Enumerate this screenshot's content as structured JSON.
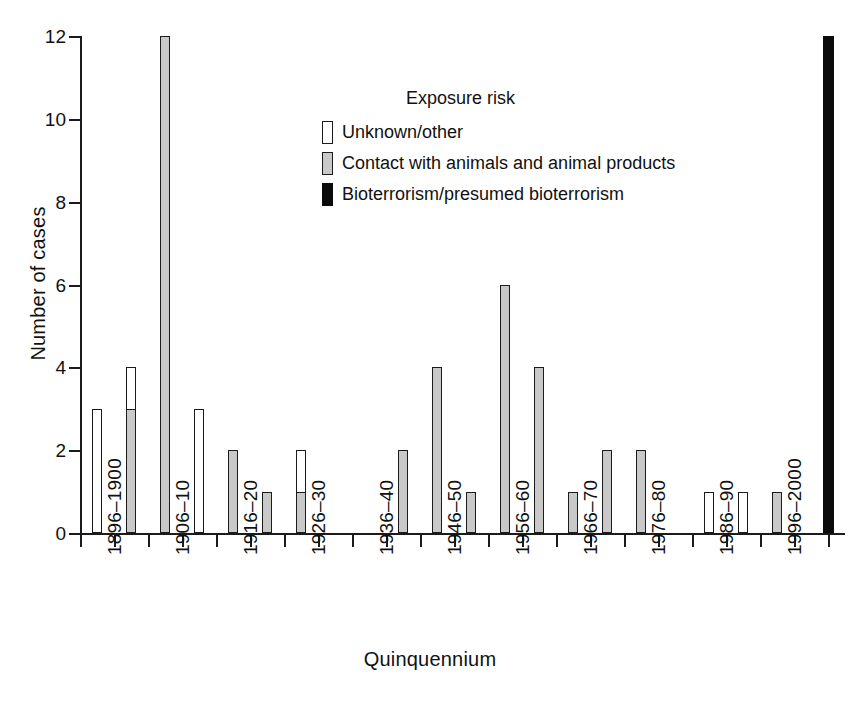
{
  "chart_data": {
    "type": "bar",
    "title": "",
    "xlabel": "Quinquennium",
    "ylabel": "Number of cases",
    "ylim": [
      0,
      12
    ],
    "yticks": [
      0,
      2,
      4,
      6,
      8,
      10,
      12
    ],
    "grid": false,
    "legend_position": "upper-center-right",
    "legend_title": "Exposure risk",
    "series": [
      {
        "name": "Unknown/other",
        "color": "#ffffff"
      },
      {
        "name": "Contact with animals and animal products",
        "color": "#c9c9c9"
      },
      {
        "name": "Bioterrorism/presumed bioterrorism",
        "color": "#0b0b0b"
      }
    ],
    "categories": [
      "1896–1900",
      "1906–10",
      "1916–20",
      "1926–30",
      "1936–40",
      "1946–50",
      "1956–60",
      "1966–70",
      "1976–80",
      "1986–90",
      "1996–2000"
    ],
    "xtick_labels": [
      "1896–1900",
      "1906–10",
      "1916–20",
      "1926–30",
      "1936–40",
      "1946–50",
      "1956–60",
      "1966–70",
      "1976–80",
      "1986–90",
      "1996–2000"
    ],
    "bars": [
      {
        "slot": 1,
        "period": "1896–1900",
        "series": "Unknown/other",
        "value": 3
      },
      {
        "slot": 3,
        "period": "1901–05",
        "series": "Unknown/other",
        "value": 4
      },
      {
        "slot": 3,
        "period": "1901–05",
        "series": "Contact with animals and animal products",
        "value": 3
      },
      {
        "slot": 5,
        "period": "1906–10",
        "series": "Unknown/other",
        "value": 3
      },
      {
        "slot": 5,
        "period": "1906–10",
        "series": "Contact with animals and animal products",
        "value": 12
      },
      {
        "slot": 7,
        "period": "1911–15",
        "series": "Unknown/other",
        "value": 3
      },
      {
        "slot": 9,
        "period": "1916–20",
        "series": "Unknown/other",
        "value": 2
      },
      {
        "slot": 9,
        "period": "1916–20",
        "series": "Contact with animals and animal products",
        "value": 2
      },
      {
        "slot": 11,
        "period": "1921–25",
        "series": "Unknown/other",
        "value": 1
      },
      {
        "slot": 11,
        "period": "1921–25",
        "series": "Contact with animals and animal products",
        "value": 1
      },
      {
        "slot": 13,
        "period": "1926–30",
        "series": "Unknown/other",
        "value": 2
      },
      {
        "slot": 13,
        "period": "1926–30",
        "series": "Contact with animals and animal products",
        "value": 1
      },
      {
        "slot": 19,
        "period": "1941–45",
        "series": "Contact with animals and animal products",
        "value": 2
      },
      {
        "slot": 21,
        "period": "1946–50",
        "series": "Unknown/other",
        "value": 2
      },
      {
        "slot": 21,
        "period": "1946–50",
        "series": "Contact with animals and animal products",
        "value": 4
      },
      {
        "slot": 23,
        "period": "1951–55",
        "series": "Unknown/other",
        "value": 1
      },
      {
        "slot": 23,
        "period": "1951–55",
        "series": "Contact with animals and animal products",
        "value": 1
      },
      {
        "slot": 25,
        "period": "1956–60",
        "series": "Unknown/other",
        "value": 1
      },
      {
        "slot": 25,
        "period": "1956–60",
        "series": "Contact with animals and animal products",
        "value": 6
      },
      {
        "slot": 27,
        "period": "1961–65",
        "series": "Unknown/other",
        "value": 1
      },
      {
        "slot": 27,
        "period": "1961–65",
        "series": "Contact with animals and animal products",
        "value": 4
      },
      {
        "slot": 29,
        "period": "1966–70",
        "series": "Contact with animals and animal products",
        "value": 1
      },
      {
        "slot": 31,
        "period": "1971–75",
        "series": "Unknown/other",
        "value": 2
      },
      {
        "slot": 31,
        "period": "1971–75",
        "series": "Contact with animals and animal products",
        "value": 2
      },
      {
        "slot": 33,
        "period": "1976–80",
        "series": "Unknown/other",
        "value": 2
      },
      {
        "slot": 33,
        "period": "1976–80",
        "series": "Contact with animals and animal products",
        "value": 2
      },
      {
        "slot": 37,
        "period": "1986–90",
        "series": "Unknown/other",
        "value": 1
      },
      {
        "slot": 39,
        "period": "1991–95",
        "series": "Unknown/other",
        "value": 1
      },
      {
        "slot": 41,
        "period": "1996–2000",
        "series": "Contact with animals and animal products",
        "value": 1
      },
      {
        "slot": 44,
        "period": "2001–05",
        "series": "Bioterrorism/presumed bioterrorism",
        "value": 12
      }
    ]
  },
  "legend": {
    "title": "Exposure risk",
    "items": [
      {
        "label": "Unknown/other",
        "swatch": "unknown"
      },
      {
        "label": "Contact with animals and animal products",
        "swatch": "contact"
      },
      {
        "label": "Bioterrorism/presumed bioterrorism",
        "swatch": "bioterror"
      }
    ]
  },
  "axes": {
    "y_title": "Number of cases",
    "x_title": "Quinquennium",
    "y_tick_labels": [
      "0",
      "2",
      "4",
      "6",
      "8",
      "10",
      "12"
    ]
  }
}
